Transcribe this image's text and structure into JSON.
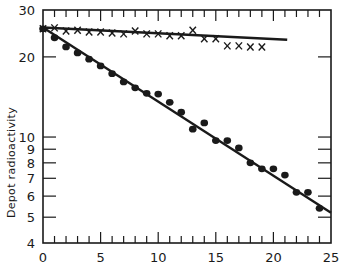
{
  "chart_data": {
    "type": "scatter",
    "title": "",
    "xlabel": "",
    "ylabel": "Depot radioactivity",
    "xlim": [
      0,
      25
    ],
    "ylim": [
      4,
      30
    ],
    "yscale": "log",
    "grid": false,
    "x_ticks_major": [
      0,
      5,
      10,
      15,
      20,
      25
    ],
    "x_tick_labels": [
      "0",
      "5",
      "10",
      "15",
      "20",
      "25"
    ],
    "y_ticks": [
      4,
      5,
      6,
      7,
      8,
      9,
      10,
      20,
      30
    ],
    "y_tick_labels": [
      "4",
      "5",
      "6",
      "7",
      "8",
      "9",
      "10",
      "20",
      "30"
    ],
    "series": [
      {
        "name": "crosses",
        "marker": "x",
        "x": [
          0,
          1,
          2,
          3,
          4,
          5,
          6,
          7,
          8,
          9,
          10,
          11,
          12,
          13,
          14,
          15,
          16,
          17,
          18,
          19
        ],
        "y": [
          25.5,
          25.7,
          25.0,
          25.2,
          24.8,
          24.8,
          24.6,
          24.4,
          25.0,
          24.4,
          24.4,
          24.0,
          24.0,
          25.2,
          23.4,
          23.4,
          22.0,
          22.0,
          21.8,
          21.8
        ],
        "fit_line": {
          "x": [
            0,
            21.2
          ],
          "y": [
            25.8,
            23.2
          ]
        }
      },
      {
        "name": "dots",
        "marker": "o",
        "x": [
          0,
          1,
          2,
          3,
          4,
          5,
          6,
          7,
          8,
          9,
          10,
          11,
          12,
          13,
          14,
          15,
          16,
          17,
          18,
          19,
          20,
          21,
          22,
          23,
          24
        ],
        "y": [
          25.5,
          23.6,
          21.8,
          20.7,
          19.6,
          18.5,
          17.3,
          16.1,
          15.3,
          14.6,
          14.5,
          13.5,
          12.4,
          10.7,
          11.3,
          9.7,
          9.7,
          9.1,
          8.0,
          7.6,
          7.6,
          7.2,
          6.2,
          6.2,
          5.4
        ],
        "fit_line": {
          "x": [
            0,
            25
          ],
          "y": [
            25.8,
            5.2
          ]
        }
      }
    ]
  },
  "axis_title_y": "Depot radioactivity",
  "colors": {
    "ink": "#1a1a1a",
    "background": "#ffffff"
  }
}
